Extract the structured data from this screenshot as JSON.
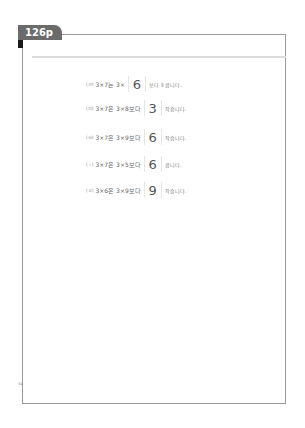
{
  "page_tab": {
    "label": "126p"
  },
  "rows": [
    {
      "marker": "(ㄹ)",
      "expression": "3×7는 3×",
      "answer": "6",
      "suffix": "보다 3 큽니다."
    },
    {
      "marker": "(ㅁ)",
      "expression": "3×7은 3×8보다",
      "answer": "3",
      "suffix": "작습니다."
    },
    {
      "marker": "(ㅂ)",
      "expression": "3×7은 3×9보다",
      "answer": "6",
      "suffix": "작습니다."
    },
    {
      "marker": "(ㅅ)",
      "expression": "3×7은 3×5보다",
      "answer": "6",
      "suffix": "큽니다."
    },
    {
      "marker": "(ㅇ)",
      "expression": "3×6은 3×9보다",
      "answer": "9",
      "suffix": "작습니다."
    }
  ],
  "footer": {
    "page_number": "34"
  }
}
